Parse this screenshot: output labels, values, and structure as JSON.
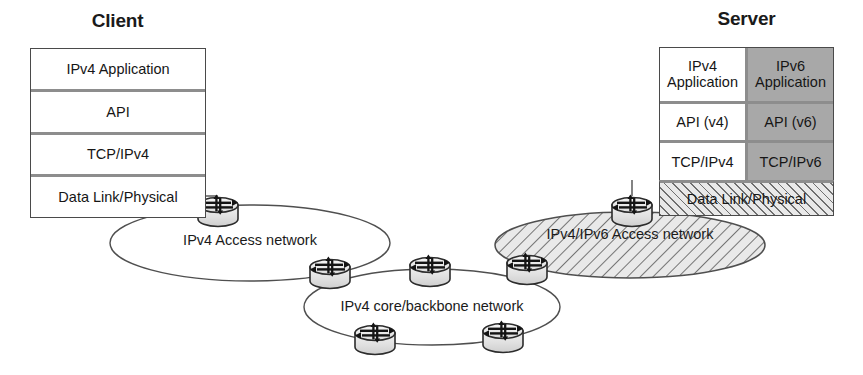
{
  "diagram": {
    "client": {
      "title": "Client",
      "layers": [
        "IPv4 Application",
        "API",
        "TCP/IPv4",
        "Data Link/Physical"
      ]
    },
    "server": {
      "title": "Server",
      "rows": [
        {
          "v4": "IPv4\nApplication",
          "v6": "IPv6\nApplication"
        },
        {
          "v4": "API (v4)",
          "v6": "API (v6)"
        },
        {
          "v4": "TCP/IPv4",
          "v6": "TCP/IPv6"
        }
      ],
      "link_layer": "Data Link/Physical"
    },
    "clouds": [
      {
        "id": "ipv4-access",
        "label": "IPv4 Access network",
        "fill": "none"
      },
      {
        "id": "ipv4-core",
        "label": "IPv4 core/backbone network",
        "fill": "none"
      },
      {
        "id": "ipv4-ipv6-access",
        "label": "IPv4/IPv6 Access network",
        "fill": "hatched"
      }
    ],
    "routers": [
      {
        "id": "router-client-access",
        "x": 218,
        "y": 208
      },
      {
        "id": "router-access-core",
        "x": 330,
        "y": 270
      },
      {
        "id": "router-core-top-mid",
        "x": 430,
        "y": 268
      },
      {
        "id": "router-core-top-right",
        "x": 527,
        "y": 266
      },
      {
        "id": "router-core-bot-left",
        "x": 375,
        "y": 336
      },
      {
        "id": "router-core-bot-right",
        "x": 503,
        "y": 334
      },
      {
        "id": "router-server-access",
        "x": 632,
        "y": 208
      }
    ],
    "colors": {
      "ipv6_shade": "#a8a8a8",
      "box_border": "#4a4a4a",
      "row_divider": "#8d8d8d",
      "line": "#4f4f4f",
      "router_body": "#e3e3e3",
      "router_outline": "#2c2c2c",
      "text": "#161616"
    }
  }
}
